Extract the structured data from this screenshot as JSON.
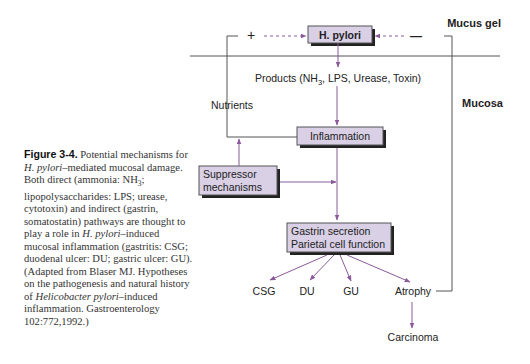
{
  "colors": {
    "arrow": "#8a5a9a",
    "box_fill": "#d9d0e6",
    "box_border": "#555555",
    "box_shadow": "#222222",
    "line": "#555555",
    "text": "#222222"
  },
  "diagram": {
    "regions": {
      "mucus_gel": "Mucus gel",
      "mucosa": "Mucosa"
    },
    "feedback": {
      "plus": "+",
      "minus": "—"
    },
    "boxes": {
      "h_pylori": "H. pylori",
      "inflammation": "Inflammation",
      "suppressor_line1": "Suppressor",
      "suppressor_line2": "mechanisms",
      "gastrin_line1": "Gastrin secretion",
      "gastrin_line2": "Parietal cell function"
    },
    "labels": {
      "products_prefix": "Products (NH",
      "products_sub": "3",
      "products_suffix": ", LPS, Urease, Toxin)",
      "nutrients": "Nutrients"
    },
    "outcomes": {
      "csg": "CSG",
      "du": "DU",
      "gu": "GU",
      "atrophy": "Atrophy",
      "carcinoma": "Carcinoma"
    }
  },
  "caption": {
    "figure_label": "Figure 3-4.",
    "part1": " Potential mechanisms for ",
    "italic1": "H. pylori",
    "part2": "–mediated mucosal damage. Both direct (ammonia: NH",
    "sub": "3",
    "part3": "; lipopolysaccharides: LPS; urease, cytotoxin) and indirect (gastrin, somatostatin) pathways are thought to play a role in ",
    "italic2": "H. pylori",
    "part4": "–induced mucosal inflammation (gastritis: CSG; duodenal ulcer: DU; gastric ulcer: GU). (Adapted from Blaser MJ. Hypotheses on the pathogenesis and natural history of ",
    "italic3": "Helicobacter pylori",
    "part5": "–induced inflammation. Gastroenterology 102:772,1992.)"
  }
}
